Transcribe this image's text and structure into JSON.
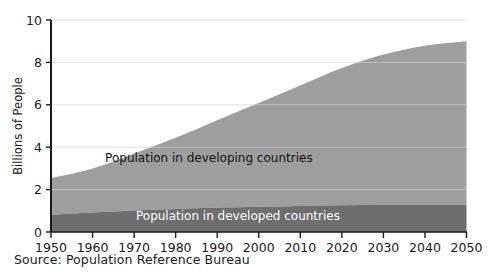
{
  "chart_data": {
    "type": "area",
    "title": "",
    "subtitle": "",
    "xlabel": "",
    "ylabel": "Billions of People",
    "xlim": [
      1950,
      2050
    ],
    "ylim": [
      0,
      10
    ],
    "grid": true,
    "stacked": true,
    "legend_position": "inline-annotation",
    "x": [
      1950,
      1960,
      1970,
      1980,
      1990,
      2000,
      2010,
      2020,
      2030,
      2040,
      2050
    ],
    "xtick_labels": [
      "1950",
      "1960",
      "1970",
      "1980",
      "1990",
      "2000",
      "2010",
      "2020",
      "2030",
      "2040",
      "2050"
    ],
    "ytick_labels": [
      "0",
      "2",
      "4",
      "6",
      "8",
      "10"
    ],
    "yticks": [
      0,
      2,
      4,
      6,
      8,
      10
    ],
    "series": [
      {
        "name": "Population in developed countries",
        "color": "#6e6e6e",
        "label_color": "#ffffff",
        "values": [
          0.81,
          0.92,
          1.01,
          1.08,
          1.15,
          1.19,
          1.23,
          1.26,
          1.28,
          1.29,
          1.28
        ]
      },
      {
        "name": "Population in developing countries",
        "color": "#9e9e9e",
        "label_color": "#111111",
        "values": [
          1.72,
          2.07,
          2.69,
          3.36,
          4.12,
          4.89,
          5.68,
          6.47,
          7.09,
          7.5,
          7.72
        ]
      }
    ],
    "totals": [
      2.53,
      2.99,
      3.7,
      4.44,
      5.27,
      6.08,
      6.91,
      7.73,
      8.37,
      8.79,
      9.0
    ],
    "annotations": [
      {
        "text": "Population in developing countries",
        "x": 1988,
        "y": 3.3
      },
      {
        "text": "Population in developed countries",
        "x": 1995,
        "y": 0.55
      }
    ],
    "source": "Source:  Population Reference Bureau",
    "colors": {
      "developing": "#9e9e9e",
      "developed": "#6e6e6e",
      "axis": "#1a1a1a",
      "gridline": "#d8d8d8",
      "background": "#ffffff"
    }
  }
}
